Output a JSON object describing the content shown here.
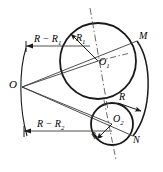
{
  "figure": {
    "type": "geometric-construction-diagram",
    "title": "",
    "background_color": "#ffffff",
    "stroke_color": "#1a1a1a",
    "thin_stroke_color": "#3a3a3a"
  },
  "labels": {
    "center_o": "O",
    "center_o1": "O",
    "center_o1_sub": "1",
    "center_o2": "O",
    "center_o2_sub": "2",
    "radius_r1": "R",
    "radius_r1_sub": "1",
    "radius_r2": "R",
    "radius_r2_sub": "2",
    "radius_r": "R",
    "point_m": "M",
    "point_n": "N",
    "dim_top": "R − R",
    "dim_top_sub": "1",
    "dim_bottom": "R − R",
    "dim_bottom_sub": "2"
  },
  "geometry": {
    "circle_big": {
      "cx": 98,
      "cy": 61,
      "r": 38,
      "name": "circle-O1"
    },
    "circle_small": {
      "cx": 112,
      "cy": 124,
      "r": 21,
      "name": "circle-O2"
    },
    "point_o": {
      "x": 22,
      "y": 87
    },
    "point_m": {
      "x": 137,
      "y": 41
    },
    "point_n": {
      "x": 133,
      "y": 136
    },
    "arc_right_label": "major-arc-R",
    "arc_left_label": "arc-through-O",
    "dim_line_top_y": 46,
    "dim_line_bottom_y": 131
  }
}
